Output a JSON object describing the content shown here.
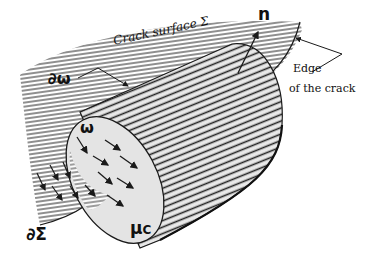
{
  "figure": {
    "labels": {
      "crack_surface": "Crack surface Σ",
      "normal": "n",
      "edge_line1": "Edge",
      "edge_line2": "of the crack",
      "boundary_omega": "∂ω",
      "omega": "ω",
      "boundary_sigma": "∂Σ",
      "mu_c": "μ",
      "mu_c_sub": "C"
    },
    "colors": {
      "ink": "#1a1a1a",
      "hatch": "#2a2a2a",
      "face_fill": "#e4e4e4",
      "background": "#ffffff"
    }
  }
}
